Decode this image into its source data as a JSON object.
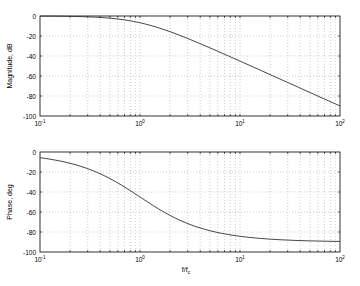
{
  "chart_data": [
    {
      "type": "line",
      "title": "",
      "xlabel": "",
      "ylabel": "Magnitude, dB",
      "xscale": "log",
      "xlim": [
        0.1,
        100
      ],
      "ylim": [
        -100,
        0
      ],
      "grid": true,
      "xticks": [
        "10^-1",
        "10^0",
        "10^1",
        "10^2"
      ],
      "yticks": [
        0,
        -20,
        -40,
        -60,
        -80,
        -100
      ],
      "x": [
        0.1,
        0.2,
        0.5,
        1,
        2,
        5,
        10,
        20,
        50,
        100
      ],
      "values": [
        -0.1,
        -0.4,
        -2.2,
        -6.8,
        -15.7,
        -31.8,
        -45.1,
        -58.6,
        -76.4,
        -90.0
      ]
    },
    {
      "type": "line",
      "title": "",
      "xlabel": "f/f_c",
      "ylabel": "Phase, deg",
      "xscale": "log",
      "xlim": [
        0.1,
        100
      ],
      "ylim": [
        -100,
        0
      ],
      "grid": true,
      "xticks": [
        "10^-1",
        "10^0",
        "10^1",
        "10^2"
      ],
      "yticks": [
        0,
        -20,
        -40,
        -60,
        -80,
        -100
      ],
      "x": [
        0.1,
        0.2,
        0.5,
        1,
        2,
        5,
        10,
        20,
        50,
        100
      ],
      "values": [
        -5.7,
        -11.3,
        -26.6,
        -45.0,
        -63.4,
        -78.7,
        -84.3,
        -87.1,
        -88.9,
        -89.4
      ]
    }
  ],
  "labels": {
    "top_ylabel": "Magnitude, dB",
    "bottom_ylabel": "Phase, deg",
    "bottom_xlabel_main": "f/f",
    "bottom_xlabel_sub": "c",
    "xtick_base": "10",
    "xtick_exps": [
      "-1",
      "0",
      "1",
      "2"
    ],
    "ytick_labels": [
      "0",
      "-20",
      "-40",
      "-60",
      "-80",
      "-100"
    ]
  }
}
